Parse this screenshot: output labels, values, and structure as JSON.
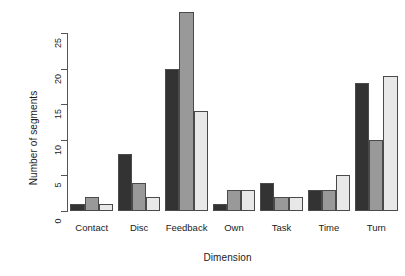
{
  "chart_data": {
    "type": "bar",
    "title": "",
    "xlabel": "Dimension",
    "ylabel": "Number of segments",
    "categories": [
      "Contact",
      "Disc",
      "Feedback",
      "Own",
      "Task",
      "Time",
      "Turn"
    ],
    "series": [
      {
        "name": "series-1",
        "color": "#333333",
        "values": [
          1,
          8,
          20,
          1,
          4,
          3,
          18
        ]
      },
      {
        "name": "series-2",
        "color": "#999999",
        "values": [
          2,
          4,
          28,
          3,
          2,
          3,
          10
        ]
      },
      {
        "name": "series-3",
        "color": "#e8e8e8",
        "values": [
          1,
          2,
          14,
          3,
          2,
          5,
          19
        ]
      }
    ],
    "ylim": [
      0,
      28.5
    ],
    "yticks": [
      0,
      5,
      10,
      15,
      20,
      25
    ],
    "ytick_labels": [
      "0",
      "5",
      "10",
      "15",
      "20",
      "25"
    ],
    "grid": false,
    "legend": "none",
    "bar_outline_color": "#4a4a4a",
    "background": "#ffffff"
  }
}
